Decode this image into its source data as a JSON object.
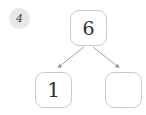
{
  "diagram": {
    "type": "number-bond",
    "step_badge": {
      "label": "4",
      "icon": "step-number-badge",
      "background_color": "#e8e8e8",
      "text_color": "#3a3a3a"
    },
    "colors": {
      "background": "#ffffff",
      "box_border": "#cacaca",
      "box_fill": "#ffffff",
      "digit": "#2e2e2e",
      "connector": "#9a9a9a"
    },
    "nodes": [
      {
        "id": "root",
        "role": "whole",
        "value": "6",
        "filled": true,
        "x": 70,
        "y": 10,
        "width": 37,
        "height": 36
      },
      {
        "id": "part-left",
        "role": "part",
        "value": "1",
        "filled": true,
        "x": 35,
        "y": 72,
        "width": 37,
        "height": 36
      },
      {
        "id": "part-right",
        "role": "part",
        "value": "",
        "filled": false,
        "x": 105,
        "y": 72,
        "width": 37,
        "height": 36
      }
    ],
    "connectors": [
      {
        "id": "root-to-left",
        "from": "root",
        "to": "part-left",
        "arrowhead": true
      },
      {
        "id": "root-to-right",
        "from": "root",
        "to": "part-right",
        "arrowhead": true
      }
    ]
  }
}
